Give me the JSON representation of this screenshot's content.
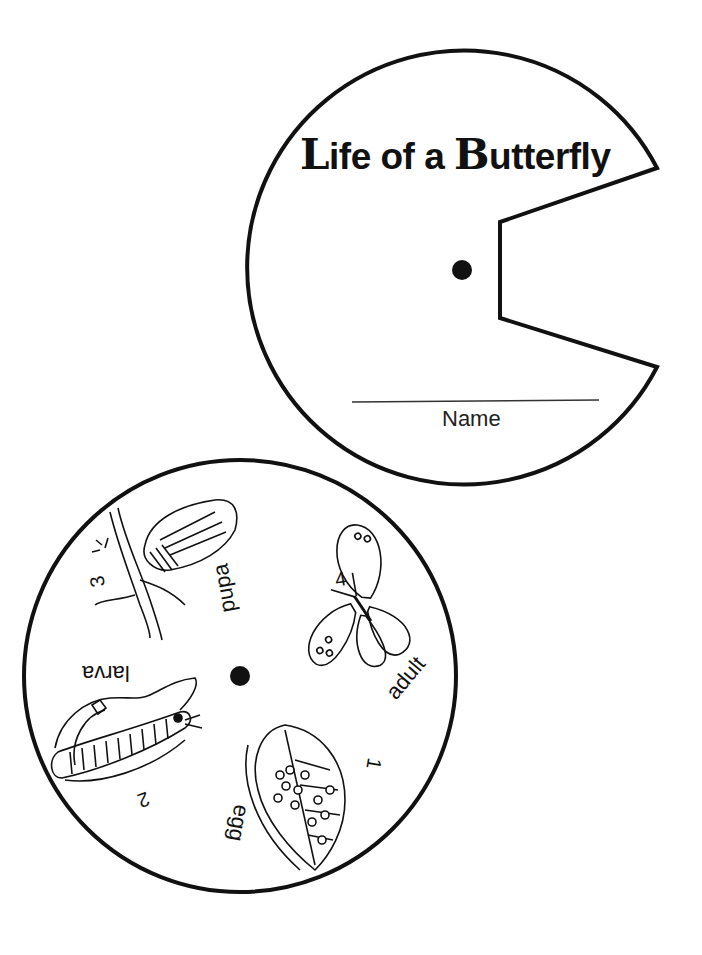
{
  "cover_wheel": {
    "title_parts": [
      {
        "text": "L",
        "style": "cap"
      },
      {
        "text": "ife of a ",
        "style": "normal"
      },
      {
        "text": "B",
        "style": "cap"
      },
      {
        "text": "utterfly",
        "style": "normal"
      }
    ],
    "name_label": "Name"
  },
  "stage_wheel": {
    "stages": [
      {
        "number": "1",
        "label": "egg",
        "icon": "egg-leaf-icon"
      },
      {
        "number": "2",
        "label": "larva",
        "icon": "caterpillar-icon"
      },
      {
        "number": "3",
        "label": "pupa",
        "icon": "chrysalis-icon"
      },
      {
        "number": "4",
        "label": "adult",
        "icon": "butterfly-icon"
      }
    ]
  },
  "colors": {
    "ink": "#111111",
    "paper": "#ffffff"
  }
}
